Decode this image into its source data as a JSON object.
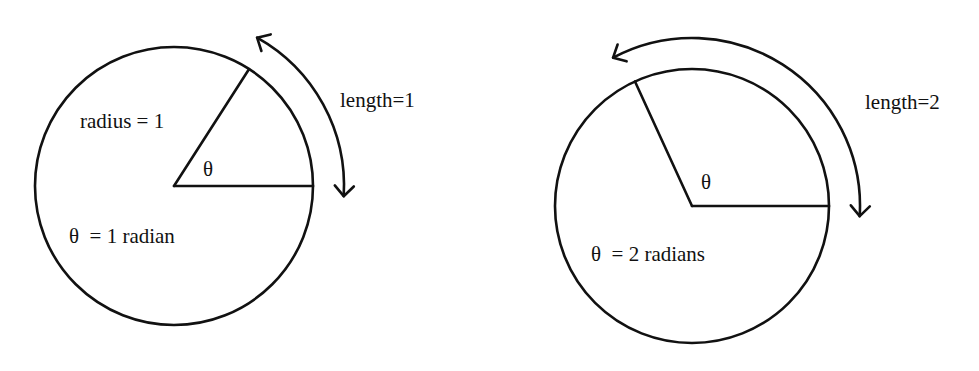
{
  "diagram": {
    "stroke_color": "#111111",
    "background_color": "#ffffff",
    "panels": [
      {
        "id": "one-radian",
        "angle_radians": 1,
        "arc_length": 1,
        "radius_value": 1,
        "labels": {
          "radius": "radius = 1",
          "theta": "θ",
          "arc_length": "length=1",
          "equation": "θ  = 1 radian"
        }
      },
      {
        "id": "two-radians",
        "angle_radians": 2,
        "arc_length": 2,
        "radius_value": 1,
        "labels": {
          "theta": "θ",
          "arc_length": "length=2",
          "equation": "θ  = 2 radians"
        }
      }
    ]
  }
}
